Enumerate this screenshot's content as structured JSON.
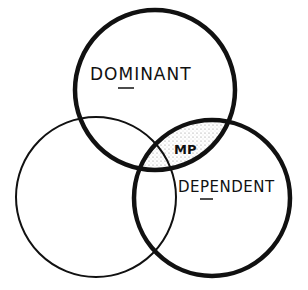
{
  "diagram": {
    "type": "venn",
    "circles": [
      {
        "id": "dominant",
        "label": "DOMINANT",
        "underlined_letter": "M",
        "cx": 155,
        "cy": 90,
        "r": 80,
        "stroke_width": 4
      },
      {
        "id": "dependent",
        "label": "DEPENDENT",
        "underlined_letter": "P",
        "cx": 212,
        "cy": 198,
        "r": 78,
        "stroke_width": 4
      },
      {
        "id": "unlabeled",
        "label": "",
        "cx": 96,
        "cy": 197,
        "r": 80,
        "stroke_width": 2
      }
    ],
    "intersection_label": "MP",
    "colors": {
      "stroke": "#111111",
      "shade": "#bbbbbb",
      "background": "#ffffff"
    }
  }
}
